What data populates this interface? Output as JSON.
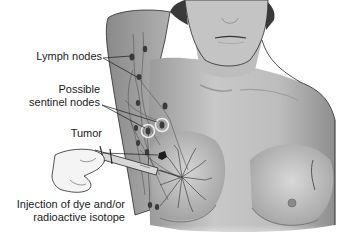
{
  "figure": {
    "labels": {
      "lymph_nodes": "Lymph nodes",
      "sentinel_line1": "Possible",
      "sentinel_line2": "sentinel nodes",
      "tumor": "Tumor",
      "injection_line1": "Injection of dye and/or",
      "injection_line2": "radioactive isotope"
    },
    "colors": {
      "skin": "#b8b8b8",
      "skin_light": "#d6d6d6",
      "outline": "#2a2a2a",
      "lymph_vessel": "#555555",
      "node": "#3a3a3a",
      "text": "#1a1a1a"
    }
  }
}
